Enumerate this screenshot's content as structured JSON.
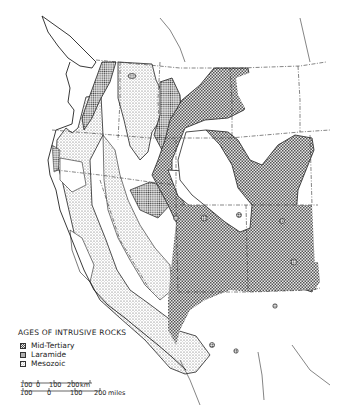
{
  "map": {
    "subject": "Western United States",
    "colors": {
      "background": "#ffffff",
      "outline": "#222222",
      "mid_tertiary_pattern": "#555555",
      "laramide_pattern": "#444444",
      "mesozoic_pattern": "#666666"
    }
  },
  "legend": {
    "title": "AGES OF INTRUSIVE ROCKS",
    "items": [
      {
        "label": "Mid-Tertiary",
        "pattern": "coarse-checker"
      },
      {
        "label": "Laramide",
        "pattern": "dense-dots"
      },
      {
        "label": "Mesozoic",
        "pattern": "fine-dots"
      }
    ]
  },
  "scale_bar": {
    "km": {
      "ticks": [
        "100",
        "0",
        "100",
        "200"
      ],
      "unit": "km"
    },
    "miles": {
      "ticks": [
        "100",
        "0",
        "100",
        "200"
      ],
      "unit": "miles"
    }
  }
}
